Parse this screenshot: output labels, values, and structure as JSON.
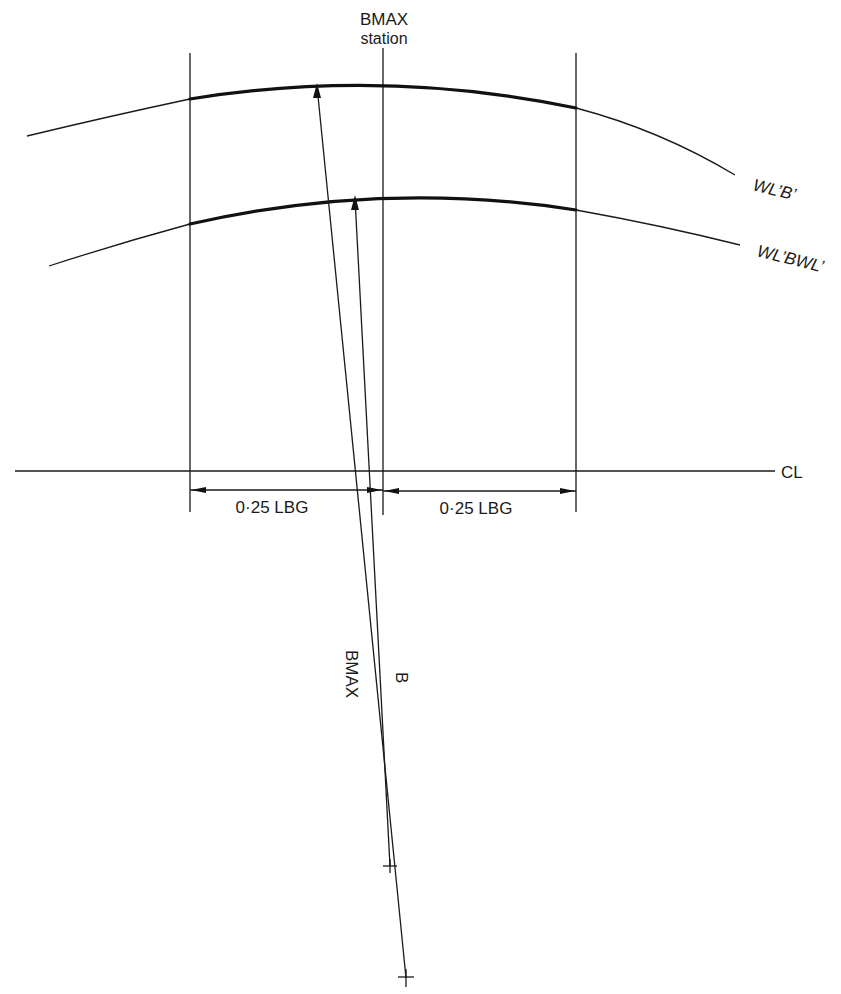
{
  "labels": {
    "station_title": "BMAX",
    "station_sub": "station",
    "waterline_b": "WL’B’",
    "waterline_bwl": "WL’BWL’",
    "centerline": "CL",
    "dim_left": "0·25 LBG",
    "dim_right": "0·25 LBG",
    "radius_bmax": "BMAX",
    "radius_b": "B"
  },
  "colors": {
    "ink": "#1a1a1a",
    "background": "#ffffff"
  }
}
